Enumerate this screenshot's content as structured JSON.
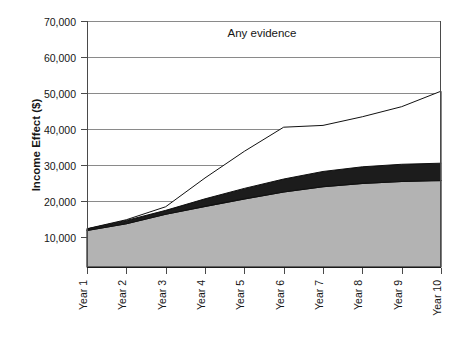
{
  "chart_data": {
    "type": "area",
    "title": "Any evidence",
    "xlabel": "",
    "ylabel": "Income Effect ($)",
    "stacked": true,
    "grid": true,
    "legend": "none",
    "categories": [
      "Year 1",
      "Year 2",
      "Year 3",
      "Year 4",
      "Year 5",
      "Year 6",
      "Year 7",
      "Year 8",
      "Year 9",
      "Year 10"
    ],
    "ytick_labels": [
      "10,000",
      "20,000",
      "30,000",
      "40,000",
      "50,000",
      "60,000",
      "70,000"
    ],
    "ytick_values": [
      10000,
      20000,
      30000,
      40000,
      50000,
      60000,
      70000
    ],
    "ylim": [
      1500,
      70000
    ],
    "series": [
      {
        "name": "lower-gray-band",
        "color": "#b3b3b3",
        "values": [
          11800,
          13700,
          16300,
          18500,
          20600,
          22500,
          24000,
          24900,
          25400,
          25700
        ]
      },
      {
        "name": "middle-dark-band",
        "color": "#1c1c1c",
        "values": [
          400,
          900,
          1100,
          2100,
          2900,
          3600,
          4200,
          4600,
          4800,
          4800
        ]
      },
      {
        "name": "upper-white-band",
        "color": "#ffffff",
        "values": [
          100,
          200,
          1000,
          5800,
          10300,
          14400,
          12800,
          13900,
          16000,
          20000
        ]
      }
    ],
    "cumulative_totals": [
      12300,
      14800,
      18400,
      26400,
      33800,
      40500,
      41000,
      43400,
      46200,
      50500
    ]
  }
}
